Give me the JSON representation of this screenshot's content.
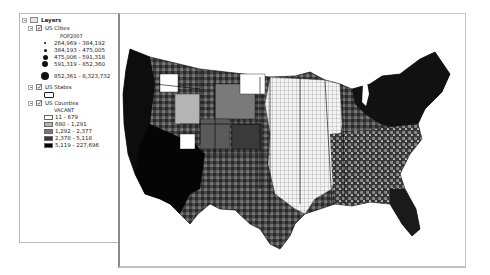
{
  "toc": {
    "root": "Layers",
    "layers": [
      {
        "name": "US Cities",
        "checked": true,
        "field": "POP2007",
        "classes": [
          {
            "label": "264,969 - 384,192",
            "size": 2
          },
          {
            "label": "384,193 - 475,005",
            "size": 3
          },
          {
            "label": "475,006 - 591,318",
            "size": 5
          },
          {
            "label": "591,319 - 852,360",
            "size": 6
          },
          {
            "label": "852,361 - 8,323,732",
            "size": 8
          }
        ]
      },
      {
        "name": "US States",
        "checked": true
      },
      {
        "name": "US Counties",
        "checked": true,
        "field": "VACANT",
        "classes": [
          {
            "label": "11 - 679",
            "color": "#ffffff"
          },
          {
            "label": "680 - 1,291",
            "color": "#b4b4b4"
          },
          {
            "label": "1,292 - 2,377",
            "color": "#7a7a7a"
          },
          {
            "label": "2,378 - 5,118",
            "color": "#3a3a3a"
          },
          {
            "label": "5,119 - 227,696",
            "color": "#000000"
          }
        ]
      }
    ]
  },
  "map": {
    "title": "US counties choropleth map of vacant housing units with city population symbols",
    "colors": {
      "class1": "#ffffff",
      "class2": "#b4b4b4",
      "class3": "#7a7a7a",
      "class4": "#3a3a3a",
      "class5": "#000000"
    }
  }
}
